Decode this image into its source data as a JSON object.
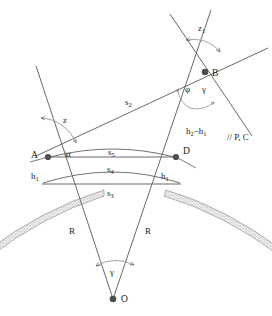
{
  "figure": {
    "type": "geodetic-refraction-diagram",
    "background_color": "#ffffff",
    "line_color": "#595959",
    "terrain_color": "#8c8c8c"
  },
  "points": {
    "a": "A",
    "b": "B",
    "d": "D",
    "o": "O"
  },
  "distances": {
    "s2": "s",
    "s2_sub": "2",
    "s3": "s",
    "s3_sub": "3",
    "s4": "s",
    "s4_sub": "4",
    "s5": "s",
    "s5_sub": "5",
    "r_left": "R",
    "r_right": "R"
  },
  "heights": {
    "h1_left": "h",
    "h1_left_sub": "1",
    "h1_right": "h",
    "h1_right_sub": "1",
    "h_diff": "h",
    "h_diff_sub1": "2",
    "h_diff_mid": "−h",
    "h_diff_sub2": "1"
  },
  "angles": {
    "z_at_a": "z",
    "z1_at_b": "z",
    "z1_at_b_sub": "1",
    "alpha_at_a": "α",
    "phi_at_b": "φ",
    "gamma_at_b": "γ",
    "gamma_at_o": "γ"
  },
  "annotations": {
    "parallel_pc": "// P, C"
  }
}
